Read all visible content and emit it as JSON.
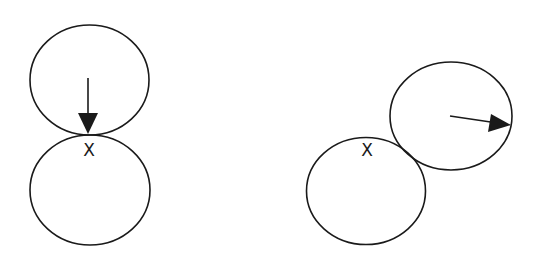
{
  "diagram": {
    "colors": {
      "stroke": "#1a1a1a",
      "background": "#ffffff"
    },
    "left": {
      "description": "two circles touching vertically, arrow pointing down to contact point",
      "top_circle": {
        "cx": 89.5,
        "cy": 80,
        "rx": 59.5,
        "ry": 55
      },
      "bottom_circle": {
        "cx": 90,
        "cy": 190,
        "rx": 60,
        "ry": 55
      },
      "arrow": {
        "x1": 88,
        "y1": 78,
        "x2": 88,
        "y2": 134,
        "direction": "down"
      },
      "marker_label": "X"
    },
    "right": {
      "description": "two circles touching diagonally, arrow pointing right from center of upper circle",
      "top_circle": {
        "cx": 451,
        "cy": 116,
        "rx": 61,
        "ry": 54
      },
      "bottom_circle": {
        "cx": 366,
        "cy": 191,
        "rx": 59.5,
        "ry": 53.5
      },
      "arrow": {
        "x1": 450,
        "y1": 116,
        "x2": 511,
        "y2": 125,
        "direction": "right"
      },
      "marker_label": "X"
    }
  }
}
